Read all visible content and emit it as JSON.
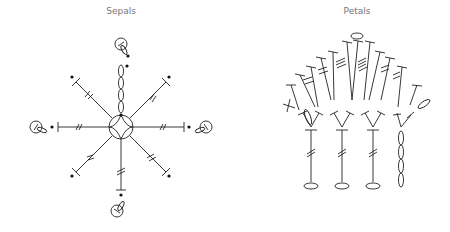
{
  "diagrams": [
    {
      "title": "Sepals",
      "center_x": 121
    },
    {
      "title": "Petals",
      "center_x": 357
    }
  ],
  "colors": {
    "line": "#222222",
    "title": "#777777",
    "background": "#ffffff"
  }
}
